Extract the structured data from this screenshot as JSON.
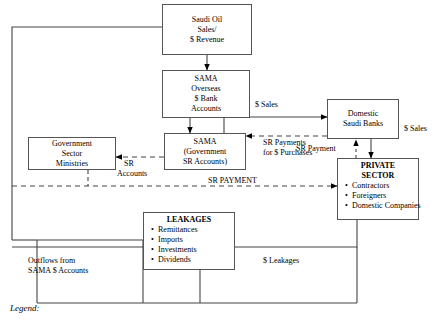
{
  "diagram": {
    "legend_label": "Legend:",
    "nodes": {
      "oil": {
        "lines": [
          "Saudi Oil",
          "Sales/",
          "$ Revenue"
        ]
      },
      "sama_overseas": {
        "lines": [
          "SAMA",
          "Overseas",
          "$ Bank",
          "Accounts"
        ]
      },
      "sama_gov": {
        "lines": [
          "SAMA",
          "(Government",
          "SR Accounts)"
        ]
      },
      "ministries": {
        "lines": [
          "Government",
          "Sector",
          "Ministries"
        ]
      },
      "banks": {
        "lines": [
          "Domestic",
          "Saudi Banks"
        ]
      },
      "private": {
        "header1": "PRIVATE",
        "header2": "SECTOR",
        "items": [
          "Contractors",
          "Foreigners",
          "Domestic Companies"
        ]
      },
      "leakages": {
        "header": "LEAKAGES",
        "items": [
          "Remittances",
          "Imports",
          "Investments",
          "Dividends"
        ]
      }
    },
    "labels": {
      "dollar_sales_top": "$ Sales",
      "dollar_sales_right": "$ Sales",
      "sr_payments_purchases_l1": "SR Payments",
      "sr_payments_purchases_l2": "for $ Purchases",
      "sr_accounts_l1": "SR",
      "sr_accounts_l2": "Accounts",
      "sr_payment": "SR Payment",
      "sr_payment_caps": "SR PAYMENT",
      "dollar_leakages": "$ Leakages",
      "outflows_l1": "Outflows from",
      "outflows_l2": "SAMA $ Accounts"
    },
    "colors": {
      "line": "#555555",
      "text": "#000000",
      "background": "#ffffff"
    }
  }
}
